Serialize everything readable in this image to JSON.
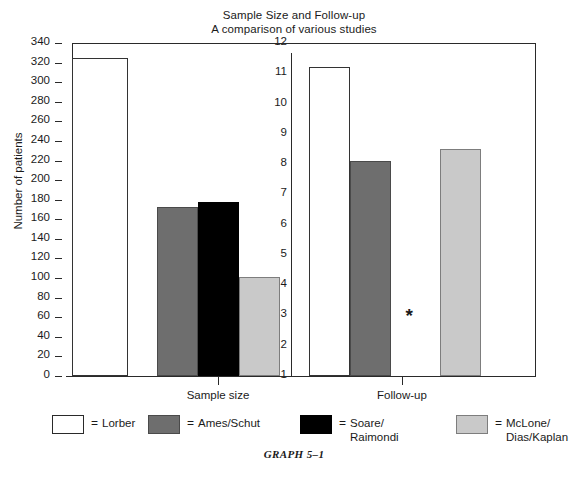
{
  "title": {
    "line1": "Sample Size and Follow-up",
    "line2": "A comparison of various studies"
  },
  "caption": "GRAPH 5–1",
  "y_axis_label": "Number of patients",
  "missing_marker": "*",
  "groups": [
    {
      "label": "Sample size"
    },
    {
      "label": "Follow-up"
    }
  ],
  "legend": [
    {
      "eq": "=",
      "label": "Lorber",
      "color": "#ffffff",
      "swatch": "white"
    },
    {
      "eq": "=",
      "label": "Ames/Schut",
      "color": "#6e6e6e",
      "swatch": "dgray"
    },
    {
      "eq": "=",
      "label": "Soare/\nRaimondi",
      "color": "#000000",
      "swatch": "black"
    },
    {
      "eq": "=",
      "label": "McLone/\nDias/Kaplan",
      "color": "#c9c9c9",
      "swatch": "lgray"
    }
  ],
  "chart_data": {
    "type": "bar",
    "title": "Sample Size and Follow-up",
    "subtitle": "A comparison of various studies",
    "xlabel": "",
    "ylabel": "Number of patients",
    "grid": false,
    "legend_position": "bottom",
    "panels": [
      {
        "name": "Sample size",
        "axis_side": "left",
        "ylabel": "Number of patients",
        "ylim": [
          0,
          340
        ],
        "ytick_step": 20,
        "yticks": [
          0,
          20,
          40,
          60,
          80,
          100,
          120,
          140,
          160,
          180,
          200,
          220,
          240,
          260,
          280,
          300,
          320,
          340
        ],
        "categories": [
          "Lorber",
          "Ames/Schut",
          "Soare/Raimondi",
          "McLone/Dias/Kaplan"
        ],
        "values": [
          325,
          173,
          178,
          101
        ]
      },
      {
        "name": "Follow-up",
        "axis_side": "middle",
        "ylabel": "Years of follow-up",
        "ylim": [
          1,
          12
        ],
        "ytick_step": 1,
        "yticks": [
          1,
          2,
          3,
          4,
          5,
          6,
          7,
          8,
          9,
          10,
          11,
          12
        ],
        "categories": [
          "Lorber",
          "Ames/Schut",
          "Soare/Raimondi",
          "McLone/Dias/Kaplan"
        ],
        "values": [
          11.2,
          8.1,
          null,
          8.5
        ],
        "missing_note": "* = no data reported for Soare/Raimondi"
      }
    ]
  }
}
